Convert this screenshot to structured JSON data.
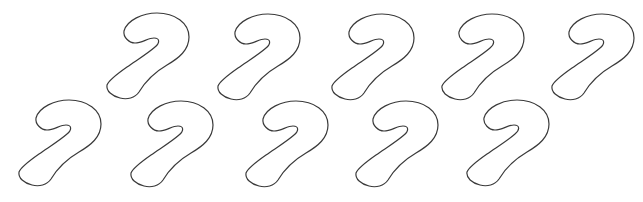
{
  "canvas": {
    "width": 643,
    "height": 202,
    "background": "#ffffff",
    "stroke_color": "#3a3a3a"
  },
  "shapes": {
    "type": "candy-cane-outline",
    "count": 10,
    "rows": [
      {
        "row": 1,
        "items": [
          {
            "x": 105,
            "y": 12
          },
          {
            "x": 216,
            "y": 13
          },
          {
            "x": 330,
            "y": 13
          },
          {
            "x": 440,
            "y": 13
          },
          {
            "x": 550,
            "y": 13
          }
        ]
      },
      {
        "row": 2,
        "items": [
          {
            "x": 17,
            "y": 99
          },
          {
            "x": 129,
            "y": 100
          },
          {
            "x": 244,
            "y": 100
          },
          {
            "x": 354,
            "y": 100
          },
          {
            "x": 465,
            "y": 99
          }
        ]
      }
    ]
  }
}
